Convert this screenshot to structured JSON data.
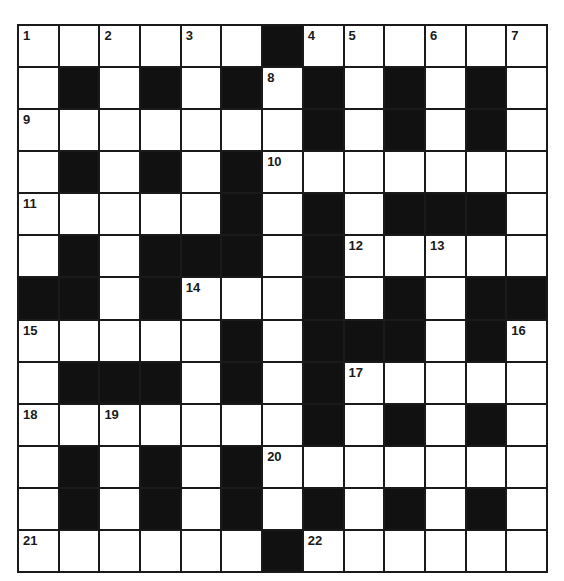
{
  "puzzle": {
    "rows": 13,
    "cols": 13,
    "colors": {
      "block": "#111111",
      "cell": "#ffffff",
      "border": "#1a1a1a"
    },
    "layout": [
      "######.######",
      "#.#.#.#.#.#.#",
      "#######.#.#.#",
      "#.#.#.#######",
      "#####.#.#...#",
      "#.#...#.#####",
      "..#.###.#.#..",
      "#####.#...#.#",
      "#...#.#.#####",
      "#######.#.#.#",
      "#.#.#.#######",
      "#.#.#.#.#.#.#",
      "######.######"
    ],
    "numbers": [
      {
        "r": 0,
        "c": 0,
        "n": "1"
      },
      {
        "r": 0,
        "c": 2,
        "n": "2"
      },
      {
        "r": 0,
        "c": 4,
        "n": "3"
      },
      {
        "r": 0,
        "c": 7,
        "n": "4"
      },
      {
        "r": 0,
        "c": 8,
        "n": "5"
      },
      {
        "r": 0,
        "c": 10,
        "n": "6"
      },
      {
        "r": 0,
        "c": 12,
        "n": "7"
      },
      {
        "r": 1,
        "c": 6,
        "n": "8"
      },
      {
        "r": 2,
        "c": 0,
        "n": "9"
      },
      {
        "r": 3,
        "c": 6,
        "n": "10"
      },
      {
        "r": 4,
        "c": 0,
        "n": "11"
      },
      {
        "r": 5,
        "c": 8,
        "n": "12"
      },
      {
        "r": 5,
        "c": 10,
        "n": "13"
      },
      {
        "r": 6,
        "c": 4,
        "n": "14"
      },
      {
        "r": 7,
        "c": 0,
        "n": "15"
      },
      {
        "r": 7,
        "c": 12,
        "n": "16"
      },
      {
        "r": 8,
        "c": 8,
        "n": "17"
      },
      {
        "r": 9,
        "c": 0,
        "n": "18"
      },
      {
        "r": 9,
        "c": 2,
        "n": "19"
      },
      {
        "r": 10,
        "c": 6,
        "n": "20"
      },
      {
        "r": 12,
        "c": 0,
        "n": "21"
      },
      {
        "r": 12,
        "c": 7,
        "n": "22"
      }
    ]
  }
}
